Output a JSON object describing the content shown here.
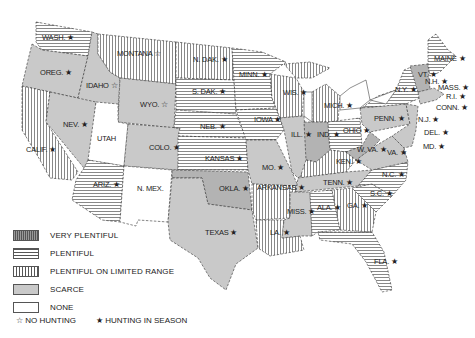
{
  "map": {
    "title": "",
    "states": [
      {
        "abbr": "WASH.",
        "category": "plentiful",
        "hunting": "in_season",
        "x": 42,
        "y": 40
      },
      {
        "abbr": "OREG.",
        "category": "scarce",
        "hunting": "in_season",
        "x": 40,
        "y": 75
      },
      {
        "abbr": "CALIF.",
        "category": "plentiful_limited",
        "hunting": "in_season",
        "x": 26,
        "y": 152
      },
      {
        "abbr": "IDAHO",
        "category": "scarce",
        "hunting": "no_hunting",
        "x": 86,
        "y": 88
      },
      {
        "abbr": "NEV.",
        "category": "scarce",
        "hunting": "in_season",
        "x": 63,
        "y": 127
      },
      {
        "abbr": "MONTANA",
        "category": "plentiful_limited",
        "hunting": "no_hunting",
        "x": 117,
        "y": 56
      },
      {
        "abbr": "WYO.",
        "category": "scarce",
        "hunting": "no_hunting",
        "x": 140,
        "y": 107
      },
      {
        "abbr": "UTAH",
        "category": "none",
        "hunting": "none",
        "x": 97,
        "y": 141
      },
      {
        "abbr": "COLO.",
        "category": "scarce",
        "hunting": "in_season",
        "x": 149,
        "y": 150
      },
      {
        "abbr": "ARIZ.",
        "category": "plentiful",
        "hunting": "in_season",
        "x": 93,
        "y": 187
      },
      {
        "abbr": "N. MEX.",
        "category": "none",
        "hunting": "none",
        "x": 137,
        "y": 191
      },
      {
        "abbr": "N. DAK.",
        "category": "plentiful_limited",
        "hunting": "in_season",
        "x": 193,
        "y": 62
      },
      {
        "abbr": "S. DAK.",
        "category": "plentiful",
        "hunting": "in_season",
        "x": 192,
        "y": 94
      },
      {
        "abbr": "NEB.",
        "category": "plentiful",
        "hunting": "in_season",
        "x": 200,
        "y": 129
      },
      {
        "abbr": "KANSAS",
        "category": "plentiful",
        "hunting": "in_season",
        "x": 205,
        "y": 161
      },
      {
        "abbr": "OKLA.",
        "category": "scarce_dark",
        "hunting": "in_season",
        "x": 219,
        "y": 191
      },
      {
        "abbr": "TEXAS",
        "category": "scarce",
        "hunting": "in_season",
        "x": 205,
        "y": 235
      },
      {
        "abbr": "MINN.",
        "category": "plentiful",
        "hunting": "in_season",
        "x": 239,
        "y": 77
      },
      {
        "abbr": "IOWA",
        "category": "plentiful",
        "hunting": "in_season",
        "x": 254,
        "y": 122
      },
      {
        "abbr": "MO.",
        "category": "scarce",
        "hunting": "in_season",
        "x": 262,
        "y": 170
      },
      {
        "abbr": "ARKANSAS",
        "category": "plentiful_limited",
        "hunting": "in_season",
        "x": 257,
        "y": 190
      },
      {
        "abbr": "LA.",
        "category": "plentiful_limited",
        "hunting": "in_season",
        "x": 270,
        "y": 235
      },
      {
        "abbr": "WIS.",
        "category": "plentiful_limited",
        "hunting": "in_season",
        "x": 283,
        "y": 95
      },
      {
        "abbr": "ILL.",
        "category": "scarce",
        "hunting": "in_season",
        "x": 291,
        "y": 137
      },
      {
        "abbr": "MICH.",
        "category": "plentiful_limited",
        "hunting": "in_season",
        "x": 324,
        "y": 108
      },
      {
        "abbr": "IND.",
        "category": "scarce_dark",
        "hunting": "in_season",
        "x": 317,
        "y": 137
      },
      {
        "abbr": "OHIO",
        "category": "plentiful",
        "hunting": "in_season",
        "x": 343,
        "y": 133
      },
      {
        "abbr": "KEN.",
        "category": "plentiful_limited",
        "hunting": "in_season",
        "x": 336,
        "y": 164
      },
      {
        "abbr": "TENN.",
        "category": "scarce",
        "hunting": "in_season",
        "x": 323,
        "y": 185
      },
      {
        "abbr": "MISS.",
        "category": "scarce",
        "hunting": "in_season",
        "x": 287,
        "y": 214
      },
      {
        "abbr": "ALA.",
        "category": "plentiful",
        "hunting": "in_season",
        "x": 317,
        "y": 210
      },
      {
        "abbr": "GA.",
        "category": "plentiful_limited",
        "hunting": "in_season",
        "x": 347,
        "y": 208
      },
      {
        "abbr": "FLA.",
        "category": "plentiful",
        "hunting": "in_season",
        "x": 374,
        "y": 264
      },
      {
        "abbr": "S.C.",
        "category": "plentiful",
        "hunting": "in_season",
        "x": 370,
        "y": 196
      },
      {
        "abbr": "N.C.",
        "category": "plentiful",
        "hunting": "in_season",
        "x": 382,
        "y": 177
      },
      {
        "abbr": "VA.",
        "category": "scarce",
        "hunting": "in_season",
        "x": 387,
        "y": 155
      },
      {
        "abbr": "W. VA.",
        "category": "scarce_dark",
        "hunting": "in_season",
        "x": 357,
        "y": 152
      },
      {
        "abbr": "PENN.",
        "category": "scarce",
        "hunting": "in_season",
        "x": 374,
        "y": 121
      },
      {
        "abbr": "N.Y.",
        "category": "plentiful",
        "hunting": "in_season",
        "x": 395,
        "y": 92
      },
      {
        "abbr": "MAINE",
        "category": "plentiful",
        "hunting": "in_season",
        "x": 434,
        "y": 61
      },
      {
        "abbr": "VT.",
        "category": "scarce_dark",
        "hunting": "in_season",
        "x": 418,
        "y": 77
      },
      {
        "abbr": "N.H.",
        "category": "scarce_dark",
        "hunting": "in_season",
        "x": 425,
        "y": 84
      },
      {
        "abbr": "MASS.",
        "category": "scarce",
        "hunting": "in_season",
        "x": 438,
        "y": 90
      },
      {
        "abbr": "R.I.",
        "category": "scarce",
        "hunting": "in_season",
        "x": 446,
        "y": 99
      },
      {
        "abbr": "CONN.",
        "category": "scarce",
        "hunting": "in_season",
        "x": 436,
        "y": 110
      },
      {
        "abbr": "N.J.",
        "category": "scarce",
        "hunting": "in_season",
        "x": 418,
        "y": 122
      },
      {
        "abbr": "DEL.",
        "category": "scarce",
        "hunting": "in_season",
        "x": 424,
        "y": 135
      },
      {
        "abbr": "MD.",
        "category": "scarce",
        "hunting": "in_season",
        "x": 423,
        "y": 149
      }
    ]
  },
  "legend": {
    "items": [
      {
        "key": "very_plentiful",
        "label": "VERY PLENTIFUL"
      },
      {
        "key": "plentiful",
        "label": "PLENTIFUL"
      },
      {
        "key": "plentiful_limited",
        "label": "PLENTIFUL ON LIMITED RANGE"
      },
      {
        "key": "scarce",
        "label": "SCARCE"
      },
      {
        "key": "none",
        "label": "NONE"
      }
    ],
    "symbols": [
      {
        "icon": "☆",
        "label": "NO HUNTING"
      },
      {
        "icon": "★",
        "label": "HUNTING IN SEASON"
      }
    ]
  },
  "colors": {
    "scarce": "#c9c9c9",
    "scarce_dark": "#b3b3b3",
    "outline": "#333333",
    "hatch": "#444444"
  }
}
